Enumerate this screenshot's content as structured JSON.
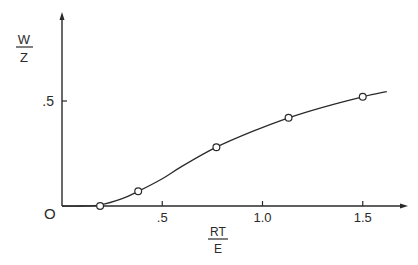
{
  "chart_data": {
    "type": "line",
    "title": "",
    "xlabel": {
      "numerator": "RT",
      "denominator": "E"
    },
    "ylabel": {
      "numerator": "W",
      "denominator": "Z"
    },
    "x_ticks": [
      {
        "value": 0.5,
        "label": ".5"
      },
      {
        "value": 1.0,
        "label": "1.0"
      },
      {
        "value": 1.5,
        "label": "1.5"
      }
    ],
    "y_ticks": [
      {
        "value": 0.5,
        "label": ".5"
      }
    ],
    "origin_label": "O",
    "xlim": [
      0,
      1.65
    ],
    "ylim": [
      0,
      0.98
    ],
    "grid": false,
    "legend": null,
    "series": [
      {
        "name": "measured",
        "marker": "open-circle",
        "points": [
          {
            "x": 0.19,
            "y": 0.0
          },
          {
            "x": 0.38,
            "y": 0.07
          },
          {
            "x": 0.77,
            "y": 0.28
          },
          {
            "x": 1.13,
            "y": 0.42
          },
          {
            "x": 1.5,
            "y": 0.52
          }
        ]
      },
      {
        "name": "fitted-curve",
        "marker": "none",
        "points": [
          {
            "x": 0.0,
            "y": 0.0
          },
          {
            "x": 0.1,
            "y": 0.0
          },
          {
            "x": 0.19,
            "y": 0.005
          },
          {
            "x": 0.3,
            "y": 0.035
          },
          {
            "x": 0.38,
            "y": 0.07
          },
          {
            "x": 0.5,
            "y": 0.13
          },
          {
            "x": 0.6,
            "y": 0.19
          },
          {
            "x": 0.77,
            "y": 0.28
          },
          {
            "x": 0.95,
            "y": 0.355
          },
          {
            "x": 1.13,
            "y": 0.42
          },
          {
            "x": 1.3,
            "y": 0.47
          },
          {
            "x": 1.5,
            "y": 0.52
          },
          {
            "x": 1.62,
            "y": 0.545
          }
        ]
      }
    ]
  }
}
